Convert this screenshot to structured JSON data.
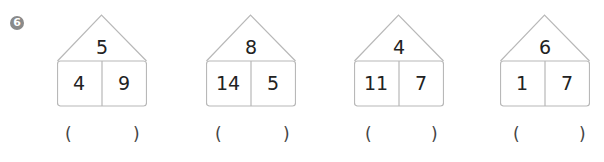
{
  "problem_number": "6",
  "houses": [
    {
      "top": "5",
      "left": "4",
      "right": "9"
    },
    {
      "top": "8",
      "left": "14",
      "right": "5"
    },
    {
      "top": "4",
      "left": "11",
      "right": "7"
    },
    {
      "top": "6",
      "left": "1",
      "right": "7"
    }
  ],
  "answer_blank": {
    "open": "(",
    "close": ")"
  }
}
